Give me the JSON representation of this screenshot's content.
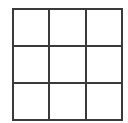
{
  "board": {
    "rows": 3,
    "cols": 3,
    "line_color": "#3a3a3a",
    "cells": [
      "",
      "",
      "",
      "",
      "",
      "",
      "",
      "",
      ""
    ]
  }
}
